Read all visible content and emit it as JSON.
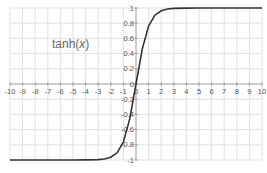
{
  "chart_data": {
    "type": "line",
    "title": "tanh(x)",
    "title_parts": {
      "fn": "tanh(",
      "var": "x",
      "close": ")"
    },
    "xlabel": "",
    "ylabel": "",
    "xlim": [
      -10,
      10
    ],
    "ylim": [
      -1,
      1
    ],
    "grid": true,
    "legend": "none",
    "x_ticks": [
      "-10",
      "-9",
      "-8",
      "-7",
      "-6",
      "-5",
      "-4",
      "-3",
      "-2",
      "-1",
      "0",
      "1",
      "2",
      "3",
      "4",
      "5",
      "6",
      "7",
      "8",
      "9",
      "10"
    ],
    "y_ticks": [
      "1",
      "0.8",
      "0.6",
      "0.4",
      "0.2",
      "0",
      "-0.2",
      "-0.4",
      "-0.6",
      "-0.8",
      "-1"
    ],
    "series": [
      {
        "name": "tanh(x)",
        "color": "#333333",
        "x": [
          -10,
          -9,
          -8,
          -7,
          -6,
          -5,
          -4,
          -3,
          -2.5,
          -2,
          -1.5,
          -1,
          -0.5,
          0,
          0.5,
          1,
          1.5,
          2,
          2.5,
          3,
          4,
          5,
          6,
          7,
          8,
          9,
          10
        ],
        "y": [
          -1,
          -1,
          -1,
          -1,
          -1,
          -1,
          -0.999,
          -0.995,
          -0.987,
          -0.964,
          -0.905,
          -0.762,
          -0.462,
          0,
          0.462,
          0.762,
          0.905,
          0.964,
          0.987,
          0.995,
          0.999,
          1,
          1,
          1,
          1,
          1,
          1
        ]
      }
    ]
  }
}
